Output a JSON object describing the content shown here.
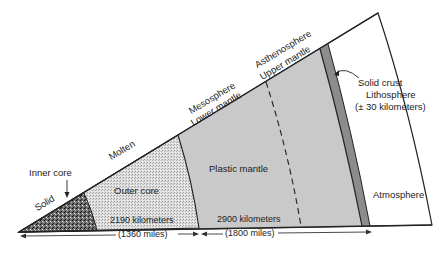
{
  "diagram": {
    "title": "",
    "type": "earth-cross-section-wedge",
    "colors": {
      "inner_core": "#5a5a5a",
      "outer_core": "#d8d8d8",
      "mantle": "#c9c9c9",
      "crust": "#8c8c8c",
      "atmosphere": "#ffffff",
      "outline": "#222222"
    },
    "layers": [
      {
        "id": "inner-core",
        "label": "Inner core",
        "state": "Solid"
      },
      {
        "id": "outer-core",
        "label": "Outer core",
        "state": "Molten"
      },
      {
        "id": "mantle",
        "label": "Plastic mantle",
        "sublabels": [
          "Mesosphere",
          "Lower mantle",
          "Asthenosphere",
          "Upper mantle"
        ]
      },
      {
        "id": "crust",
        "label": "Solid crust",
        "sublabels": [
          "Lithosphere",
          "(± 30 kilometers)"
        ]
      },
      {
        "id": "atmosphere",
        "label": "Atmosphere"
      }
    ],
    "labels": {
      "inner_core": "Inner core",
      "solid": "Solid",
      "molten": "Molten",
      "outer_core": "Outer core",
      "mesosphere": "Mesosphere",
      "lower_mantle": "Lower mantle",
      "asthenosphere": "Asthenosphere",
      "upper_mantle": "Upper mantle",
      "plastic_mantle": "Plastic mantle",
      "solid_crust": "Solid crust",
      "lithosphere": "Lithosphere",
      "lithosphere_thickness": "(± 30 kilometers)",
      "atmosphere": "Atmosphere"
    },
    "dimensions": {
      "core_km": "2190 kilometers",
      "core_miles": "(1360 miles)",
      "mantle_km": "2900 kilometers",
      "mantle_miles": "(1800 miles)"
    }
  }
}
